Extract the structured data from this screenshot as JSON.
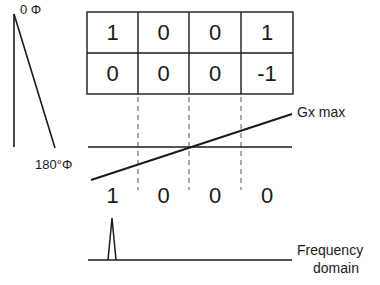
{
  "phase_axis": {
    "top_label": "0 Φ",
    "bottom_label": "180°Φ"
  },
  "matrix": {
    "rows": [
      [
        "1",
        "0",
        "0",
        "1"
      ],
      [
        "0",
        "0",
        "0",
        "-1"
      ]
    ]
  },
  "gradient": {
    "label": "Gx max"
  },
  "result_row": {
    "values": [
      "1",
      "0",
      "0",
      "0"
    ]
  },
  "frequency_axis": {
    "label_line1": "Frequency",
    "label_line2": "domain"
  },
  "colors": {
    "stroke": "#1a1a1a",
    "background": "#ffffff"
  }
}
